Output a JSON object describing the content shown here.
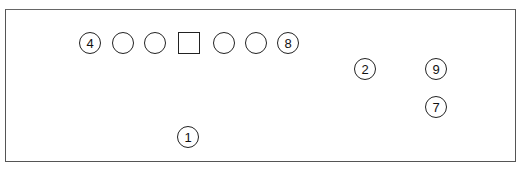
{
  "diagram": {
    "frame": {
      "border_color": "#555555"
    },
    "row": [
      {
        "shape": "circle",
        "label": "4",
        "cx": 90,
        "cy": 43
      },
      {
        "shape": "circle",
        "label": "",
        "cx": 123,
        "cy": 43
      },
      {
        "shape": "circle",
        "label": "",
        "cx": 155,
        "cy": 43
      },
      {
        "shape": "square",
        "label": "",
        "cx": 189,
        "cy": 43
      },
      {
        "shape": "circle",
        "label": "",
        "cx": 224,
        "cy": 43
      },
      {
        "shape": "circle",
        "label": "",
        "cx": 256,
        "cy": 43
      },
      {
        "shape": "circle",
        "label": "8",
        "cx": 288,
        "cy": 43
      }
    ],
    "markers": [
      {
        "label": "2",
        "cx": 365,
        "cy": 69
      },
      {
        "label": "9",
        "cx": 436,
        "cy": 69
      },
      {
        "label": "7",
        "cx": 436,
        "cy": 107
      },
      {
        "label": "1",
        "cx": 188,
        "cy": 137
      }
    ]
  }
}
